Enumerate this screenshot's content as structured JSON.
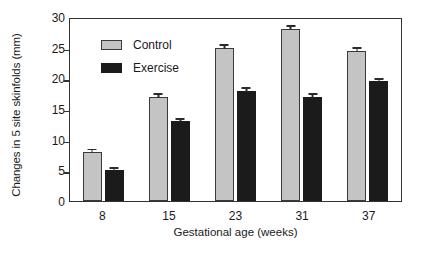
{
  "chart_data": {
    "type": "bar",
    "title": "",
    "xlabel": "Gestational age (weeks)",
    "ylabel": "Changes in 5 site skinfolds (mm)",
    "categories": [
      "8",
      "15",
      "23",
      "31",
      "37"
    ],
    "ylim": [
      0,
      30
    ],
    "yticks": [
      0,
      5,
      10,
      15,
      20,
      25,
      30
    ],
    "ytick_labels": [
      "0",
      "5",
      "10",
      "15",
      "20",
      "25",
      "30"
    ],
    "grid": false,
    "legend_position": "upper-left-inside",
    "series": [
      {
        "name": "Control",
        "color": "#c4c4c4",
        "values": [
          8,
          17,
          25,
          28,
          24.5
        ],
        "errors": [
          0.4,
          0.4,
          0.5,
          0.5,
          0.5
        ]
      },
      {
        "name": "Exercise",
        "color": "#1b1b1b",
        "values": [
          5,
          13,
          18,
          17,
          19.5
        ],
        "errors": [
          0.4,
          0.4,
          0.4,
          0.4,
          0.4
        ]
      }
    ]
  },
  "legend": {
    "items": [
      {
        "label": "Control"
      },
      {
        "label": "Exercise"
      }
    ]
  },
  "axes": {
    "y_title": "Changes in 5 site skinfolds (mm)",
    "x_title": "Gestational age (weeks)"
  }
}
